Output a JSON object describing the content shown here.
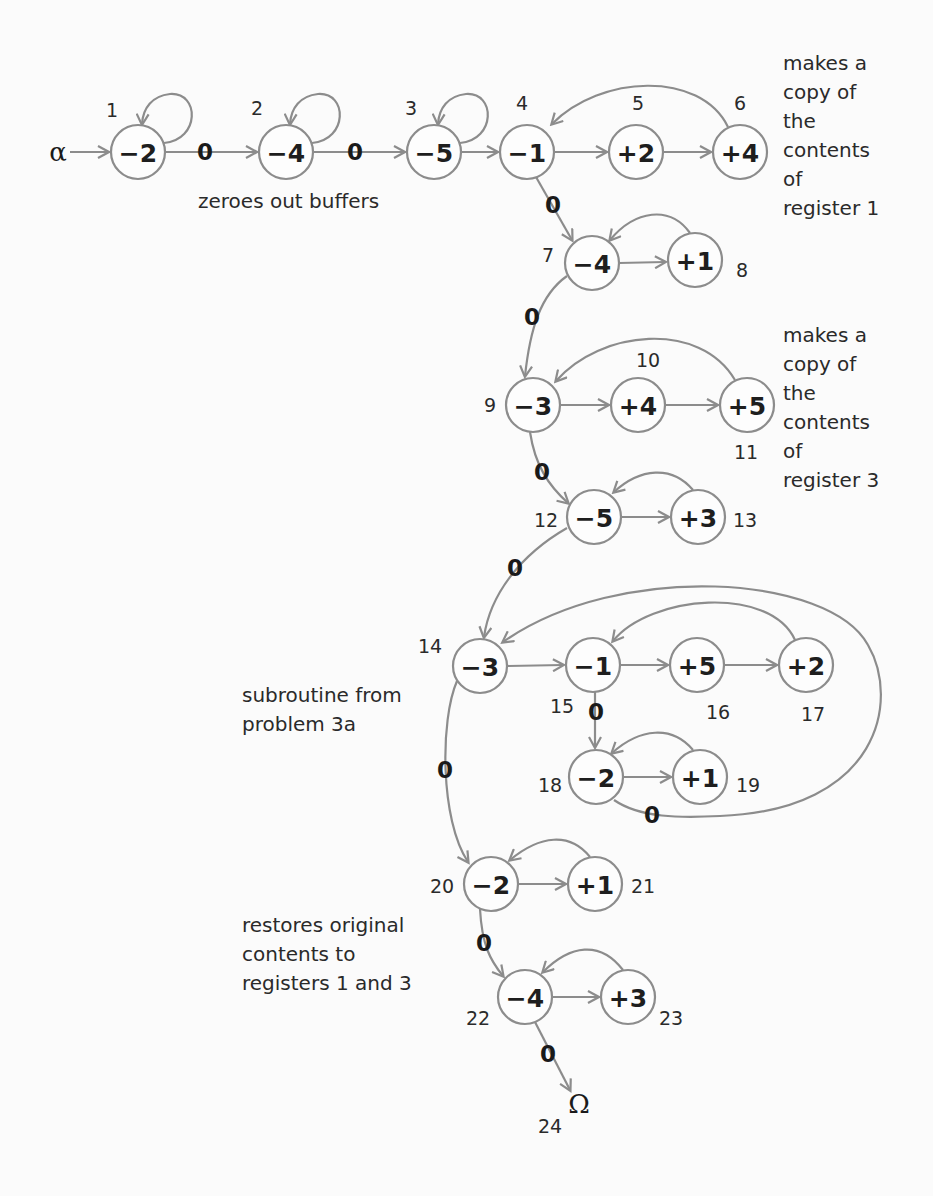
{
  "diagram": {
    "colors": {
      "stroke": "#8c8c8c",
      "text": "#1e1e1e",
      "background": "#fbfbfb"
    },
    "start": {
      "symbol": "α",
      "x": 58,
      "y": 152
    },
    "end": {
      "symbol": "Ω",
      "number": "24",
      "x": 579,
      "y": 1104,
      "num_x": 550,
      "num_y": 1126
    },
    "node_radius": 27,
    "nodes": [
      {
        "id": 1,
        "op": "−2",
        "x": 138,
        "y": 152,
        "num_x": 112,
        "num_y": 110
      },
      {
        "id": 2,
        "op": "−4",
        "x": 286,
        "y": 152,
        "num_x": 257,
        "num_y": 108
      },
      {
        "id": 3,
        "op": "−5",
        "x": 434,
        "y": 152,
        "num_x": 411,
        "num_y": 108
      },
      {
        "id": 4,
        "op": "−1",
        "x": 527,
        "y": 152,
        "num_x": 522,
        "num_y": 103
      },
      {
        "id": 5,
        "op": "+2",
        "x": 636,
        "y": 152,
        "num_x": 638,
        "num_y": 103
      },
      {
        "id": 6,
        "op": "+4",
        "x": 740,
        "y": 152,
        "num_x": 740,
        "num_y": 103
      },
      {
        "id": 7,
        "op": "−4",
        "x": 592,
        "y": 263,
        "num_x": 548,
        "num_y": 255
      },
      {
        "id": 8,
        "op": "+1",
        "x": 695,
        "y": 260,
        "num_x": 742,
        "num_y": 270
      },
      {
        "id": 9,
        "op": "−3",
        "x": 533,
        "y": 405,
        "num_x": 490,
        "num_y": 405
      },
      {
        "id": 10,
        "op": "+4",
        "x": 638,
        "y": 405,
        "num_x": 648,
        "num_y": 360
      },
      {
        "id": 11,
        "op": "+5",
        "x": 747,
        "y": 405,
        "num_x": 746,
        "num_y": 452
      },
      {
        "id": 12,
        "op": "−5",
        "x": 594,
        "y": 517,
        "num_x": 546,
        "num_y": 520
      },
      {
        "id": 13,
        "op": "+3",
        "x": 698,
        "y": 517,
        "num_x": 745,
        "num_y": 520
      },
      {
        "id": 14,
        "op": "−3",
        "x": 480,
        "y": 666,
        "num_x": 430,
        "num_y": 646
      },
      {
        "id": 15,
        "op": "−1",
        "x": 593,
        "y": 665,
        "num_x": 562,
        "num_y": 706
      },
      {
        "id": 16,
        "op": "+5",
        "x": 697,
        "y": 665,
        "num_x": 718,
        "num_y": 712
      },
      {
        "id": 17,
        "op": "+2",
        "x": 806,
        "y": 665,
        "num_x": 813,
        "num_y": 714
      },
      {
        "id": 18,
        "op": "−2",
        "x": 596,
        "y": 777,
        "num_x": 550,
        "num_y": 785
      },
      {
        "id": 19,
        "op": "+1",
        "x": 700,
        "y": 777,
        "num_x": 748,
        "num_y": 785
      },
      {
        "id": 20,
        "op": "−2",
        "x": 491,
        "y": 884,
        "num_x": 442,
        "num_y": 886
      },
      {
        "id": 21,
        "op": "+1",
        "x": 595,
        "y": 884,
        "num_x": 643,
        "num_y": 886
      },
      {
        "id": 22,
        "op": "−4",
        "x": 525,
        "y": 997,
        "num_x": 478,
        "num_y": 1018
      },
      {
        "id": 23,
        "op": "+3",
        "x": 628,
        "y": 997,
        "num_x": 671,
        "num_y": 1018
      }
    ],
    "edges": [
      {
        "from": "α",
        "to": 1,
        "path": "M 70 152 L 108 152",
        "arrow": true
      },
      {
        "from": 1,
        "to": 1,
        "type": "self-loop",
        "path": "M 164 143 C 200 140, 200 92, 170 94 C 152 96, 143 108, 142 124",
        "arrow": true
      },
      {
        "from": 1,
        "to": 2,
        "label": "0",
        "label_x": 205,
        "label_y": 152,
        "path": "M 165 152 L 256 152",
        "arrow": true
      },
      {
        "from": 2,
        "to": 2,
        "type": "self-loop",
        "path": "M 312 143 C 348 140, 348 92, 318 94 C 300 96, 291 108, 290 124",
        "arrow": true
      },
      {
        "from": 2,
        "to": 3,
        "label": "0",
        "label_x": 355,
        "label_y": 152,
        "path": "M 313 152 L 404 152",
        "arrow": true
      },
      {
        "from": 3,
        "to": 3,
        "type": "self-loop",
        "path": "M 460 143 C 496 140, 496 92, 466 94 C 448 96, 439 108, 438 124",
        "arrow": true
      },
      {
        "from": 3,
        "to": 4,
        "path": "M 461 152 L 497 152",
        "arrow": true
      },
      {
        "from": 4,
        "to": 5,
        "path": "M 554 152 L 606 152",
        "arrow": true
      },
      {
        "from": 5,
        "to": 6,
        "path": "M 663 152 L 710 152",
        "arrow": true
      },
      {
        "from": 6,
        "to": 4,
        "type": "back",
        "path": "M 728 127 C 700 70, 600 75, 552 124",
        "arrow": true
      },
      {
        "from": 4,
        "to": 7,
        "label": "0",
        "label_x": 553,
        "label_y": 205,
        "path": "M 536 177 L 572 240",
        "arrow": true
      },
      {
        "from": 7,
        "to": 8,
        "path": "M 619 263 L 665 262",
        "arrow": true
      },
      {
        "from": 8,
        "to": 7,
        "type": "back",
        "path": "M 690 233 C 670 205, 635 210, 610 240",
        "arrow": true
      },
      {
        "from": 7,
        "to": 9,
        "label": "0",
        "label_x": 532,
        "label_y": 317,
        "path": "M 567 276 C 540 295, 530 330, 525 376",
        "arrow": true
      },
      {
        "from": 9,
        "to": 10,
        "path": "M 560 405 L 608 405",
        "arrow": true
      },
      {
        "from": 10,
        "to": 11,
        "path": "M 665 405 L 717 405",
        "arrow": true
      },
      {
        "from": 11,
        "to": 9,
        "type": "back",
        "path": "M 735 380 C 700 320, 600 330, 556 381",
        "arrow": true
      },
      {
        "from": 9,
        "to": 12,
        "label": "0",
        "label_x": 542,
        "label_y": 472,
        "path": "M 530 432 C 535 465, 548 485, 568 503",
        "arrow": true
      },
      {
        "from": 12,
        "to": 13,
        "path": "M 621 517 L 668 517",
        "arrow": true
      },
      {
        "from": 13,
        "to": 12,
        "type": "back",
        "path": "M 693 490 C 672 465, 640 468, 614 492",
        "arrow": true
      },
      {
        "from": 12,
        "to": 14,
        "label": "0",
        "label_x": 515,
        "label_y": 568,
        "path": "M 567 528 C 520 555, 490 595, 484 637",
        "arrow": true
      },
      {
        "from": 14,
        "to": 15,
        "path": "M 507 666 L 563 665",
        "arrow": true
      },
      {
        "from": 15,
        "to": 16,
        "path": "M 620 665 L 667 665",
        "arrow": true
      },
      {
        "from": 16,
        "to": 17,
        "path": "M 724 665 L 776 665",
        "arrow": true
      },
      {
        "from": 17,
        "to": 15,
        "type": "back",
        "path": "M 795 640 C 770 585, 650 595, 613 641",
        "arrow": true
      },
      {
        "from": 15,
        "to": 18,
        "label": "0",
        "label_x": 596,
        "label_y": 712,
        "path": "M 595 692 L 595 747",
        "arrow": true
      },
      {
        "from": 18,
        "to": 19,
        "path": "M 623 777 L 670 777",
        "arrow": true
      },
      {
        "from": 19,
        "to": 18,
        "type": "back",
        "path": "M 693 750 C 672 725, 640 728, 612 753",
        "arrow": true
      },
      {
        "from": 18,
        "to": 14,
        "label": "0",
        "label_x": 652,
        "label_y": 815,
        "type": "outer-loop",
        "path": "M 614 800 C 640 818, 680 818, 720 816 C 880 810, 900 700, 868 645 C 830 575, 620 560, 503 642",
        "arrow": true
      },
      {
        "from": 14,
        "to": 20,
        "label": "0",
        "label_x": 445,
        "label_y": 770,
        "path": "M 457 681 C 440 720, 440 820, 468 862",
        "arrow": true
      },
      {
        "from": 20,
        "to": 21,
        "path": "M 518 884 L 565 884",
        "arrow": true
      },
      {
        "from": 21,
        "to": 20,
        "type": "back",
        "path": "M 590 857 C 570 832, 540 835, 510 860",
        "arrow": true
      },
      {
        "from": 20,
        "to": 22,
        "label": "0",
        "label_x": 484,
        "label_y": 943,
        "path": "M 480 909 C 482 945, 490 960, 503 976",
        "arrow": true
      },
      {
        "from": 22,
        "to": 23,
        "path": "M 552 997 L 598 997",
        "arrow": true
      },
      {
        "from": 23,
        "to": 22,
        "type": "back",
        "path": "M 623 970 C 600 940, 570 945, 543 972",
        "arrow": true
      },
      {
        "from": 22,
        "to": "Ω",
        "label": "0",
        "label_x": 548,
        "label_y": 1054,
        "path": "M 535 1022 L 570 1090",
        "arrow": true
      }
    ],
    "annotations": [
      {
        "id": "zero-out",
        "x": 198,
        "y": 208,
        "lines": [
          "zeroes out buffers"
        ]
      },
      {
        "id": "copy-register-1",
        "x": 783,
        "y": 70,
        "lines": [
          "makes a",
          "copy of",
          "the",
          "contents",
          "of",
          "register 1"
        ]
      },
      {
        "id": "copy-register-3",
        "x": 783,
        "y": 342,
        "lines": [
          "makes a",
          "copy of",
          "the",
          "contents",
          "of",
          "register 3"
        ]
      },
      {
        "id": "subroutine",
        "x": 242,
        "y": 702,
        "lines": [
          "subroutine from",
          "problem 3a"
        ]
      },
      {
        "id": "restore",
        "x": 242,
        "y": 932,
        "lines": [
          "restores original",
          "contents to",
          "registers 1 and  3"
        ]
      }
    ],
    "line_height": 29
  }
}
